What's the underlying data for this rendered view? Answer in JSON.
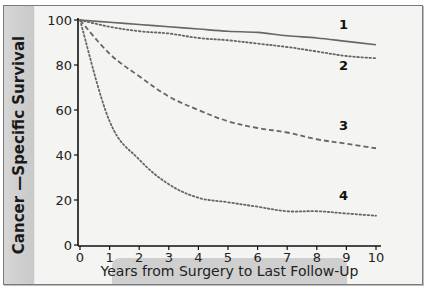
{
  "chart_data": {
    "type": "line",
    "title": "",
    "xlabel": "Years from Surgery to Last Follow-Up",
    "ylabel": "Cancer —Specific Survival",
    "xlim": [
      0,
      10
    ],
    "ylim": [
      0,
      100
    ],
    "x_ticks": [
      0,
      1,
      2,
      3,
      4,
      5,
      6,
      7,
      8,
      9,
      10
    ],
    "y_ticks": [
      0,
      20,
      40,
      60,
      80,
      100
    ],
    "grid": false,
    "legend": "inline labels near curve ends",
    "x": [
      0,
      1,
      2,
      3,
      4,
      5,
      6,
      7,
      8,
      9,
      10
    ],
    "series": [
      {
        "name": "1",
        "style": "solid",
        "values": [
          100,
          99,
          98,
          97,
          96,
          95,
          94.5,
          93,
          92,
          90.5,
          89
        ]
      },
      {
        "name": "2",
        "style": "dotted",
        "values": [
          100,
          97,
          95,
          94,
          92,
          91,
          89.5,
          88,
          86,
          84,
          83
        ]
      },
      {
        "name": "3",
        "style": "dashed",
        "values": [
          100,
          85,
          75,
          66,
          60,
          55,
          52,
          50,
          47,
          45,
          43
        ]
      },
      {
        "name": "4",
        "style": "dotted",
        "values": [
          100,
          55,
          38,
          27,
          21,
          19,
          17,
          15,
          15,
          14,
          13
        ]
      }
    ],
    "series_label_positions": [
      {
        "name": "1",
        "x": 8.9,
        "y": 96
      },
      {
        "name": "2",
        "x": 8.9,
        "y": 78
      },
      {
        "name": "3",
        "x": 8.9,
        "y": 51
      },
      {
        "name": "4",
        "x": 8.9,
        "y": 20
      }
    ]
  },
  "colors": {
    "frame_bg": "#f4f4f2",
    "band": "#cfcfcf",
    "line": "#666666",
    "axis": "#111111"
  }
}
